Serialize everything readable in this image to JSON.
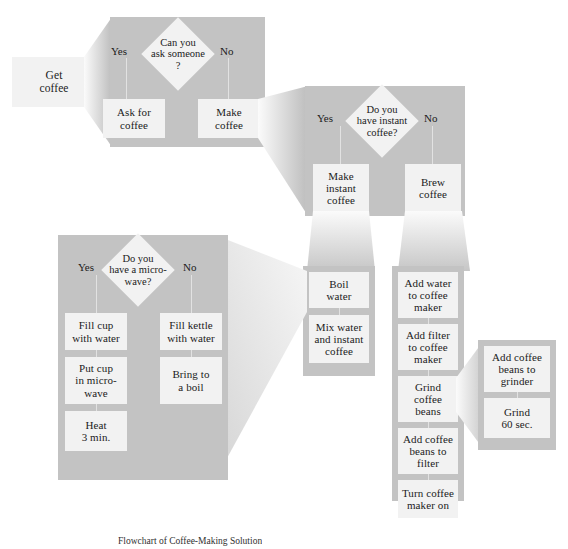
{
  "figure": {
    "caption": "Flowchart of Coffee-Making Solution",
    "colors": {
      "panel": "#c3c3c3",
      "box": "#f2f2f2",
      "background": "#ffffff",
      "text": "#1b1b1b",
      "connector": "#e2e2e2"
    }
  },
  "start": {
    "label": "Get\ncoffee"
  },
  "level1": {
    "decision": "Can you\nask someone\n?",
    "yes_label": "Yes",
    "no_label": "No",
    "yes_box": "Ask for\ncoffee",
    "no_box": "Make\ncoffee"
  },
  "level2": {
    "decision": "Do you\nhave instant\ncoffee?",
    "yes_label": "Yes",
    "no_label": "No",
    "yes_box": "Make\ninstant\ncoffee",
    "no_box": "Brew\ncoffee"
  },
  "level3_instant": {
    "steps": [
      "Boil\nwater",
      "Mix water\nand instant\ncoffee"
    ]
  },
  "level3_brew": {
    "steps": [
      "Add water\nto coffee\nmaker",
      "Add filter\nto coffee\nmaker",
      "Grind\ncoffee\nbeans",
      "Add coffee\nbeans to\nfilter",
      "Turn coffee\nmaker on"
    ]
  },
  "level4_microwave": {
    "decision": "Do you\nhave a micro-\nwave?",
    "yes_label": "Yes",
    "no_label": "No",
    "yes_steps": [
      "Fill cup\nwith water",
      "Put cup\nin micro-\nwave",
      "Heat\n3 min."
    ],
    "no_steps": [
      "Fill kettle\nwith water",
      "Bring to\na boil"
    ]
  },
  "level4_grinder": {
    "steps": [
      "Add coffee\nbeans to\ngrinder",
      "Grind\n60 sec."
    ]
  }
}
